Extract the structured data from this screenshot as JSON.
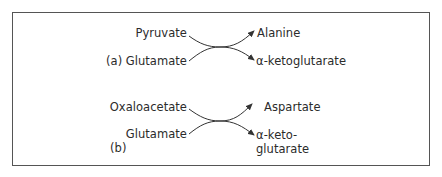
{
  "diagram": {
    "type": "transamination-reactions",
    "panels": [
      {
        "label": "(a)",
        "reactants": [
          "Pyruvate",
          "Glutamate"
        ],
        "products": [
          "Alanine",
          "α-ketoglutarate"
        ]
      },
      {
        "label": "(b)",
        "reactants": [
          "Oxaloacetate",
          "Glutamate"
        ],
        "products": [
          "Aspartate",
          "α-keto-",
          "glutarate"
        ]
      }
    ],
    "colors": {
      "text": "#2b2b2b",
      "stroke": "#333333",
      "frame": "#555555",
      "background": "#ffffff"
    }
  }
}
